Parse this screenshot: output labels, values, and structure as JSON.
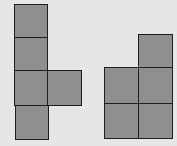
{
  "diagram": {
    "background": "#e6e6e6",
    "fill": "#8f8f8f",
    "stroke": "#1e1e1e",
    "shapes": [
      {
        "name": "left-shape",
        "squares": [
          {
            "x": 14,
            "y": 4,
            "w": 34,
            "h": 34
          },
          {
            "x": 14,
            "y": 37,
            "w": 34,
            "h": 35
          },
          {
            "x": 14,
            "y": 70,
            "w": 34,
            "h": 36
          },
          {
            "x": 47,
            "y": 70,
            "w": 35,
            "h": 36
          },
          {
            "x": 15,
            "y": 105,
            "w": 34,
            "h": 35
          }
        ]
      },
      {
        "name": "right-shape",
        "squares": [
          {
            "x": 138,
            "y": 34,
            "w": 35,
            "h": 35
          },
          {
            "x": 104,
            "y": 67,
            "w": 35,
            "h": 37
          },
          {
            "x": 138,
            "y": 67,
            "w": 35,
            "h": 37
          },
          {
            "x": 104,
            "y": 103,
            "w": 35,
            "h": 36
          },
          {
            "x": 138,
            "y": 103,
            "w": 35,
            "h": 36
          }
        ]
      }
    ]
  }
}
